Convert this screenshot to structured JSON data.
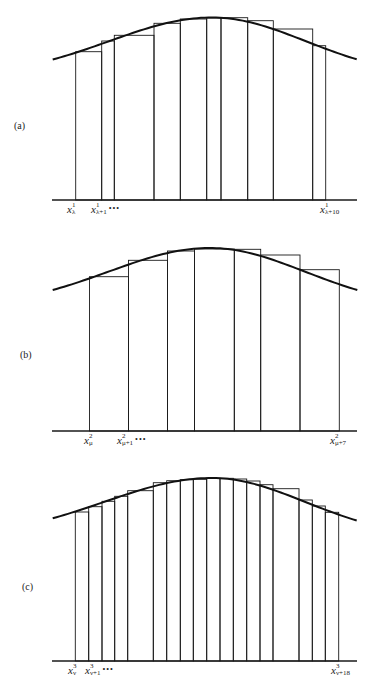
{
  "figure": {
    "stroke_color": "#1a1a1a",
    "curve_color": "#111111",
    "background": "#ffffff"
  },
  "panels": [
    {
      "id": "a",
      "label": "(a)",
      "label_pos": {
        "x": 14,
        "y": 120
      },
      "baseline": {
        "y": 200,
        "x1": 52,
        "x2": 357
      },
      "curve": {
        "x_start": 52.7,
        "y_start": 59.5,
        "x_peak": 212,
        "y_peak": 17.5,
        "x_end": 356.7,
        "y_end": 59.3
      },
      "bars": [
        {
          "x1": 75.7,
          "x2": 101.7,
          "top": 51.7
        },
        {
          "x1": 101.7,
          "x2": 114.3,
          "top": 41
        },
        {
          "x1": 114.3,
          "x2": 154,
          "top": 35.3
        },
        {
          "x1": 154,
          "x2": 180.3,
          "top": 23.3
        },
        {
          "x1": 180.3,
          "x2": 206.7,
          "top": 19
        },
        {
          "x1": 206.7,
          "x2": 221,
          "top": 18
        },
        {
          "x1": 221,
          "x2": 247.7,
          "top": 17.7
        },
        {
          "x1": 247.7,
          "x2": 273.3,
          "top": 20.7
        },
        {
          "x1": 273.3,
          "x2": 312.7,
          "top": 29
        },
        {
          "x1": 312.7,
          "x2": 325.7,
          "top": 45.7
        }
      ],
      "xlabels": [
        {
          "base": "x",
          "sup": "1",
          "sub": "λ",
          "dots": "",
          "x": 67,
          "y": 204
        },
        {
          "base": "x",
          "sup": "1",
          "sub": "λ+1",
          "dots": "•••",
          "x": 91,
          "y": 204
        },
        {
          "base": "x",
          "sup": "1",
          "sub": "λ+10",
          "dots": "",
          "x": 320,
          "y": 204
        }
      ]
    },
    {
      "id": "b",
      "label": "(b)",
      "label_pos": {
        "x": 20,
        "y": 349
      },
      "baseline": {
        "y": 431,
        "x1": 52,
        "x2": 357
      },
      "curve": {
        "x_start": 52.7,
        "y_start": 290,
        "x_peak": 210,
        "y_peak": 248,
        "x_end": 357.3,
        "y_end": 290
      },
      "bars": [
        {
          "x1": 89.5,
          "x2": 128.5,
          "top": 276.7
        },
        {
          "x1": 128.5,
          "x2": 167.5,
          "top": 260.3
        },
        {
          "x1": 167.5,
          "x2": 194.5,
          "top": 251
        },
        {
          "x1": 194.5,
          "x2": 234.3,
          "top": 249
        },
        {
          "x1": 234.3,
          "x2": 260.7,
          "top": 249.3
        },
        {
          "x1": 260.7,
          "x2": 300,
          "top": 255
        },
        {
          "x1": 300,
          "x2": 339.3,
          "top": 269.7
        }
      ],
      "xlabels": [
        {
          "base": "x",
          "sup": "2",
          "sub": "μ",
          "dots": "",
          "x": 84,
          "y": 435
        },
        {
          "base": "x",
          "sup": "2",
          "sub": "μ+1",
          "dots": "•••",
          "x": 117,
          "y": 435
        },
        {
          "base": "x",
          "sup": "2",
          "sub": "μ+7",
          "dots": "",
          "x": 330,
          "y": 435
        }
      ]
    },
    {
      "id": "c",
      "label": "(c)",
      "label_pos": {
        "x": 22,
        "y": 581
      },
      "baseline": {
        "y": 661,
        "x1": 52,
        "x2": 357
      },
      "curve": {
        "x_start": 52.7,
        "y_start": 518.3,
        "x_peak": 212,
        "y_peak": 478,
        "x_end": 356.7,
        "y_end": 520.5
      },
      "bars": [
        {
          "x1": 75.3,
          "x2": 88.7,
          "top": 512
        },
        {
          "x1": 88.7,
          "x2": 102,
          "top": 506.7
        },
        {
          "x1": 102,
          "x2": 114.7,
          "top": 501.3
        },
        {
          "x1": 114.7,
          "x2": 127.7,
          "top": 496.3
        },
        {
          "x1": 127.7,
          "x2": 153.3,
          "top": 490.7
        },
        {
          "x1": 153.3,
          "x2": 166.7,
          "top": 482.7
        },
        {
          "x1": 166.7,
          "x2": 180.3,
          "top": 480.7
        },
        {
          "x1": 180.3,
          "x2": 193.3,
          "top": 479.7
        },
        {
          "x1": 193.3,
          "x2": 206.7,
          "top": 479.3
        },
        {
          "x1": 206.7,
          "x2": 220,
          "top": 478.3
        },
        {
          "x1": 220,
          "x2": 233.3,
          "top": 478.3
        },
        {
          "x1": 233.3,
          "x2": 246.7,
          "top": 479
        },
        {
          "x1": 246.7,
          "x2": 260,
          "top": 481
        },
        {
          "x1": 260,
          "x2": 273,
          "top": 484.7
        },
        {
          "x1": 273,
          "x2": 299,
          "top": 488.7
        },
        {
          "x1": 299,
          "x2": 312.3,
          "top": 500
        },
        {
          "x1": 312.3,
          "x2": 325.3,
          "top": 506
        },
        {
          "x1": 325.3,
          "x2": 338.7,
          "top": 512.3
        }
      ],
      "xlabels": [
        {
          "base": "x",
          "sup": "3",
          "sub": "ν",
          "dots": "",
          "x": 68,
          "y": 665
        },
        {
          "base": "x",
          "sup": "3",
          "sub": "ν+1",
          "dots": "•••",
          "x": 85,
          "y": 665
        },
        {
          "base": "x",
          "sup": "3",
          "sub": "ν+18",
          "dots": "",
          "x": 331,
          "y": 665
        }
      ]
    }
  ]
}
